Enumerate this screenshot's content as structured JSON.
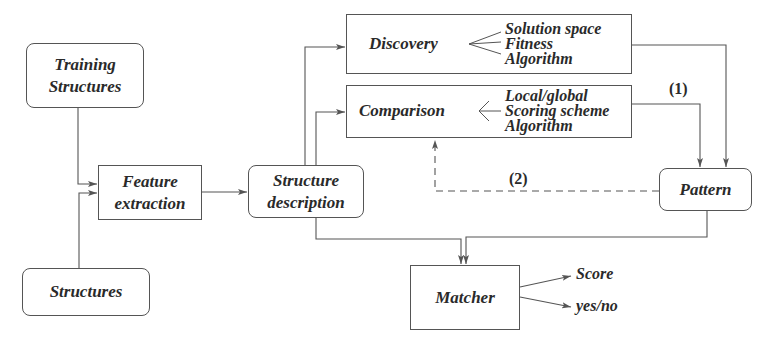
{
  "diagram": {
    "nodes": {
      "training_structures": {
        "lines": [
          "Training",
          "Structures"
        ]
      },
      "structures": {
        "lines": [
          "Structures"
        ]
      },
      "feature_extraction": {
        "lines": [
          "Feature",
          "extraction"
        ]
      },
      "structure_description": {
        "lines": [
          "Structure",
          "description"
        ]
      },
      "discovery": {
        "label": "Discovery",
        "sub_items": [
          "Solution space",
          "Fitness",
          "Algorithm"
        ]
      },
      "comparison": {
        "label": "Comparison",
        "sub_items": [
          "Local/global",
          "Scoring scheme",
          "Algorithm"
        ]
      },
      "pattern": {
        "lines": [
          "Pattern"
        ]
      },
      "matcher": {
        "lines": [
          "Matcher"
        ]
      }
    },
    "outputs": {
      "score": "Score",
      "yes_no": "yes/no"
    },
    "edge_labels": {
      "path_1": "(1)",
      "path_2": "(2)"
    },
    "colors": {
      "stroke": "#555555",
      "text": "#2a2a2a",
      "background": "#ffffff"
    }
  }
}
